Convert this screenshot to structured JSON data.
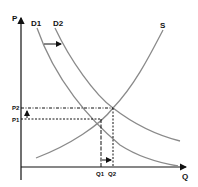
{
  "diagram": {
    "type": "supply-demand",
    "axes": {
      "y_label": "P",
      "x_label": "Q"
    },
    "curves": {
      "demand_1": "D1",
      "demand_2": "D2",
      "supply": "S"
    },
    "price_levels": {
      "p1": "P1",
      "p2": "P2"
    },
    "quantity_levels": {
      "q1": "Q1",
      "q2": "Q2"
    },
    "annotations": [
      "Arrow showing demand shift from D1 to D2",
      "Arrow showing price rise from P1 to P2",
      "Arrow showing quantity rise from Q1 to Q2"
    ],
    "colors": {
      "axis": "#111111",
      "curve": "#8a8a8a",
      "guide": "#111111"
    }
  }
}
